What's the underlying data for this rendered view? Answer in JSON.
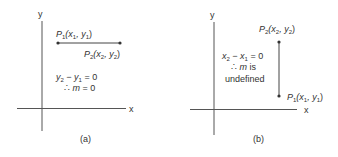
{
  "figures": [
    {
      "id": "a",
      "caption": "(a)",
      "y_axis_label": "y",
      "x_axis_label": "x",
      "p1_label": "P",
      "p1_sub": "1",
      "p1_coords_open": "(x",
      "p1_coords_sub1": "1",
      "p1_coords_mid": ", y",
      "p1_coords_sub2": "1",
      "p1_coords_close": ")",
      "p2_label": "P",
      "p2_sub": "2",
      "p2_coords_open": "(x",
      "p2_coords_sub1": "2",
      "p2_coords_mid": ", y",
      "p2_coords_sub2": "2",
      "p2_coords_close": ")",
      "eq_line1_a": "y",
      "eq_line1_a_sub": "2",
      "eq_line1_b": " − y",
      "eq_line1_b_sub": "1",
      "eq_line1_c": " = 0",
      "eq_line2_therefore": "∴ ",
      "eq_line2_var": "m",
      "eq_line2_rest": " = 0",
      "segment": "horizontal"
    },
    {
      "id": "b",
      "caption": "(b)",
      "y_axis_label": "y",
      "x_axis_label": "x",
      "p1_label": "P",
      "p1_sub": "1",
      "p1_coords_open": "(x",
      "p1_coords_sub1": "1",
      "p1_coords_mid": ", y",
      "p1_coords_sub2": "1",
      "p1_coords_close": ")",
      "p2_label": "P",
      "p2_sub": "2",
      "p2_coords_open": "(x",
      "p2_coords_sub1": "2",
      "p2_coords_mid": ", y",
      "p2_coords_sub2": "2",
      "p2_coords_close": ")",
      "eq_line1_a": "x",
      "eq_line1_a_sub": "2",
      "eq_line1_b": " − x",
      "eq_line1_b_sub": "1",
      "eq_line1_c": " = 0",
      "eq_line2_therefore": "∴ ",
      "eq_line2_var": "m",
      "eq_line2_rest": " is",
      "eq_line3": "undefined",
      "segment": "vertical"
    }
  ]
}
